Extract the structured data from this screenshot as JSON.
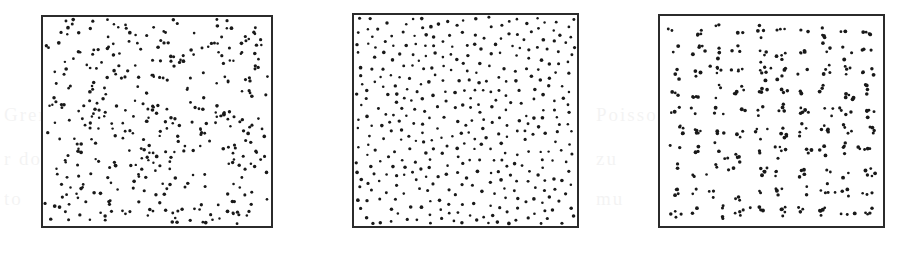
{
  "figure": {
    "background_color": "#ffffff",
    "ink_color": "#191919",
    "frame_color": "#2b2b2b",
    "panel_count": 3
  },
  "ghost_text": {
    "note": "extremely faint show-through text from the reverse page",
    "lines": [
      {
        "text": "Gren ofoon and la",
        "x": 4,
        "y": 104
      },
      {
        "text": "r dom",
        "x": 4,
        "y": 148
      },
      {
        "text": "to",
        "x": 4,
        "y": 188
      },
      {
        "text": "Poisson ist",
        "x": 596,
        "y": 104
      },
      {
        "text": "zu",
        "x": 596,
        "y": 148
      },
      {
        "text": "mu",
        "x": 596,
        "y": 188
      }
    ]
  },
  "panels": [
    {
      "id": "panel-random",
      "label": "(a)",
      "pattern_type": "random",
      "description": "Homogeneous Poisson process — complete spatial randomness",
      "box": {
        "x": 41,
        "y": 15,
        "width": 232,
        "height": 213
      },
      "point_count": 400,
      "dot_radius": 1.45,
      "seed": 20114
    },
    {
      "id": "panel-regular",
      "label": "(b)",
      "pattern_type": "regular",
      "description": "Regular (inhibition / hard-core) point process",
      "box": {
        "x": 352,
        "y": 13,
        "width": 227,
        "height": 215
      },
      "point_count": 400,
      "dot_radius": 1.45,
      "seed": 77231,
      "inhibition_distance": 7.4
    },
    {
      "id": "panel-clustered",
      "label": "(c)",
      "pattern_type": "clustered",
      "description": "Clustered point process — parent lattice with offspring clusters",
      "box": {
        "x": 658,
        "y": 14,
        "width": 227,
        "height": 214
      },
      "grid_rows": 10,
      "grid_cols": 10,
      "cluster_count": 100,
      "points_per_cluster_min": 2,
      "points_per_cluster_max": 5,
      "cluster_spread": 3.4,
      "point_count": 340,
      "dot_radius": 1.55,
      "seed": 51377
    }
  ],
  "chart_data": {
    "type": "scatter",
    "xlabel": "",
    "ylabel": "",
    "grid": false,
    "legend": "none",
    "axis_ticks": "none",
    "series": [
      {
        "name": "random",
        "pattern_type": "random",
        "n": 400,
        "xlim": [
          0,
          1
        ],
        "ylim": [
          0,
          1
        ],
        "generator": "homogeneous Poisson (complete spatial randomness)"
      },
      {
        "name": "regular",
        "pattern_type": "regular",
        "n": 400,
        "xlim": [
          0,
          1
        ],
        "ylim": [
          0,
          1
        ],
        "generator": "simple sequential inhibition, hard-core radius 0.033"
      },
      {
        "name": "clustered",
        "pattern_type": "clustered",
        "n": 340,
        "xlim": [
          0,
          1
        ],
        "ylim": [
          0,
          1
        ],
        "generator": "100 lattice parents (10x10), 2-5 offspring each, sd 0.015"
      }
    ]
  }
}
